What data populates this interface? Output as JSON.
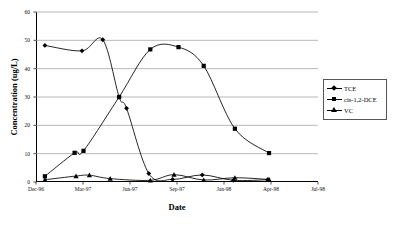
{
  "chart_data": {
    "type": "line",
    "title": "",
    "xlabel": "Date",
    "ylabel": "Concentration (ug/L)",
    "ylim": [
      0,
      60
    ],
    "yticks": [
      0,
      10,
      20,
      30,
      40,
      50,
      60
    ],
    "xtick_labels": [
      "Dec-96",
      "Mar-97",
      "Jun-97",
      "Sep-97",
      "Jan-98",
      "Apr-98",
      "Jul-98"
    ],
    "grid": true,
    "grid_axis": "y",
    "legend_position": "right",
    "x_unit": "months since Dec-96",
    "x_range": [
      0,
      19
    ],
    "series": [
      {
        "name": "TCE",
        "marker": "diamond",
        "color": "#000000",
        "points": [
          {
            "x": 0.6,
            "y": 48.2
          },
          {
            "x": 3.1,
            "y": 46.3
          },
          {
            "x": 4.5,
            "y": 50.2
          },
          {
            "x": 5.6,
            "y": 30.0
          },
          {
            "x": 6.1,
            "y": 26.0
          },
          {
            "x": 7.6,
            "y": 3.0
          },
          {
            "x": 9.2,
            "y": 0.9
          },
          {
            "x": 11.2,
            "y": 2.5
          },
          {
            "x": 13.3,
            "y": 0.6
          },
          {
            "x": 15.6,
            "y": 0.8
          }
        ]
      },
      {
        "name": "cis-1,2-DCE",
        "marker": "square",
        "color": "#000000",
        "points": [
          {
            "x": 0.6,
            "y": 2.0
          },
          {
            "x": 2.6,
            "y": 10.3
          },
          {
            "x": 3.2,
            "y": 11.0
          },
          {
            "x": 5.6,
            "y": 30.0
          },
          {
            "x": 7.7,
            "y": 46.8
          },
          {
            "x": 9.6,
            "y": 47.6
          },
          {
            "x": 11.3,
            "y": 41.0
          },
          {
            "x": 13.4,
            "y": 18.8
          },
          {
            "x": 15.7,
            "y": 10.2
          }
        ]
      },
      {
        "name": "VC",
        "marker": "triangle",
        "color": "#000000",
        "points": [
          {
            "x": 0.6,
            "y": 0.8
          },
          {
            "x": 2.7,
            "y": 2.1
          },
          {
            "x": 3.6,
            "y": 2.4
          },
          {
            "x": 5.0,
            "y": 1.2
          },
          {
            "x": 7.7,
            "y": 0.6
          },
          {
            "x": 9.3,
            "y": 2.6
          },
          {
            "x": 11.3,
            "y": 0.7
          },
          {
            "x": 13.4,
            "y": 1.5
          },
          {
            "x": 15.7,
            "y": 0.9
          }
        ]
      }
    ]
  },
  "legend": {
    "items": [
      {
        "label": "TCE"
      },
      {
        "label": "cis-1,2-DCE"
      },
      {
        "label": "VC"
      }
    ]
  }
}
